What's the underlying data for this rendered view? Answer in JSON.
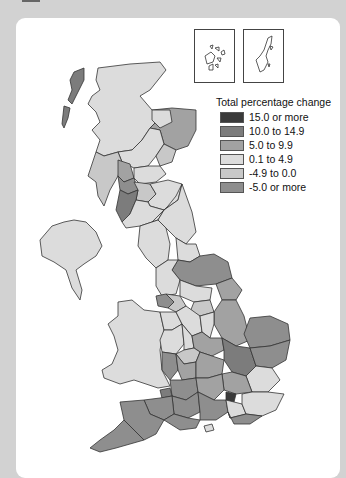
{
  "map": {
    "title": "",
    "region": "United Kingdom",
    "insets": [
      {
        "name": "Orkney"
      },
      {
        "name": "Shetland"
      }
    ]
  },
  "legend": {
    "title": "Total percentage change",
    "items": [
      {
        "label": "15.0 or more",
        "color": "#3a3a3a"
      },
      {
        "label": "10.0 to 14.9",
        "color": "#7c7c7c"
      },
      {
        "label": "5.0 to 9.9",
        "color": "#a2a2a2"
      },
      {
        "label": "0.1 to 4.9",
        "color": "#dcdcdc"
      },
      {
        "label": "-4.9 to 0.0",
        "color": "#c8c8c8"
      },
      {
        "label": "-5.0 or more",
        "color": "#8e8e8e"
      }
    ]
  }
}
